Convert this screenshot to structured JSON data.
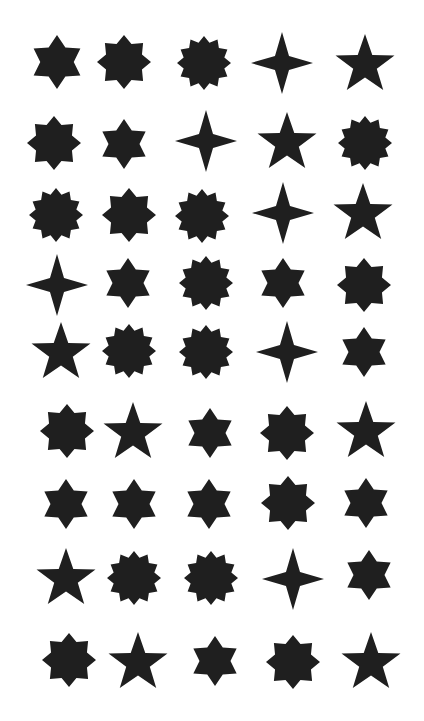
{
  "fill_color": "#1f1f1f",
  "background_color": "#ffffff",
  "grid": {
    "rows": 9,
    "columns": 5
  },
  "shapes": [
    {
      "row": 1,
      "col": 1,
      "points": 6,
      "cx": 57,
      "cy": 62,
      "r": 27,
      "inner": 0.62
    },
    {
      "row": 1,
      "col": 2,
      "points": 8,
      "cx": 124,
      "cy": 62,
      "r": 27,
      "inner": 0.72
    },
    {
      "row": 1,
      "col": 3,
      "points": 12,
      "cx": 204,
      "cy": 63,
      "r": 27,
      "inner": 0.78
    },
    {
      "row": 1,
      "col": 4,
      "points": 4,
      "cx": 282,
      "cy": 63,
      "r": 31,
      "inner": 0.32
    },
    {
      "row": 1,
      "col": 5,
      "points": 5,
      "cx": 365,
      "cy": 65,
      "r": 31,
      "inner": 0.4
    },
    {
      "row": 2,
      "col": 1,
      "points": 8,
      "cx": 54,
      "cy": 143,
      "r": 27,
      "inner": 0.72
    },
    {
      "row": 2,
      "col": 2,
      "points": 6,
      "cx": 124,
      "cy": 144,
      "r": 25,
      "inner": 0.62
    },
    {
      "row": 2,
      "col": 3,
      "points": 4,
      "cx": 206,
      "cy": 141,
      "r": 31,
      "inner": 0.32
    },
    {
      "row": 2,
      "col": 4,
      "points": 5,
      "cx": 287,
      "cy": 143,
      "r": 31,
      "inner": 0.4
    },
    {
      "row": 2,
      "col": 5,
      "points": 12,
      "cx": 365,
      "cy": 143,
      "r": 27,
      "inner": 0.78
    },
    {
      "row": 3,
      "col": 1,
      "points": 12,
      "cx": 56,
      "cy": 215,
      "r": 27,
      "inner": 0.78
    },
    {
      "row": 3,
      "col": 2,
      "points": 8,
      "cx": 129,
      "cy": 215,
      "r": 27,
      "inner": 0.72
    },
    {
      "row": 3,
      "col": 3,
      "points": 12,
      "cx": 202,
      "cy": 216,
      "r": 27,
      "inner": 0.78
    },
    {
      "row": 3,
      "col": 4,
      "points": 4,
      "cx": 283,
      "cy": 213,
      "r": 31,
      "inner": 0.32
    },
    {
      "row": 3,
      "col": 5,
      "points": 5,
      "cx": 363,
      "cy": 214,
      "r": 31,
      "inner": 0.4
    },
    {
      "row": 4,
      "col": 1,
      "points": 4,
      "cx": 57,
      "cy": 285,
      "r": 31,
      "inner": 0.32
    },
    {
      "row": 4,
      "col": 2,
      "points": 6,
      "cx": 128,
      "cy": 283,
      "r": 25,
      "inner": 0.62
    },
    {
      "row": 4,
      "col": 3,
      "points": 12,
      "cx": 206,
      "cy": 283,
      "r": 27,
      "inner": 0.78
    },
    {
      "row": 4,
      "col": 4,
      "points": 6,
      "cx": 283,
      "cy": 283,
      "r": 25,
      "inner": 0.62
    },
    {
      "row": 4,
      "col": 5,
      "points": 8,
      "cx": 364,
      "cy": 285,
      "r": 27,
      "inner": 0.72
    },
    {
      "row": 5,
      "col": 1,
      "points": 5,
      "cx": 61,
      "cy": 353,
      "r": 31,
      "inner": 0.4
    },
    {
      "row": 5,
      "col": 2,
      "points": 12,
      "cx": 129,
      "cy": 351,
      "r": 27,
      "inner": 0.78
    },
    {
      "row": 5,
      "col": 3,
      "points": 12,
      "cx": 206,
      "cy": 352,
      "r": 27,
      "inner": 0.78
    },
    {
      "row": 5,
      "col": 4,
      "points": 4,
      "cx": 287,
      "cy": 352,
      "r": 31,
      "inner": 0.32
    },
    {
      "row": 5,
      "col": 5,
      "points": 6,
      "cx": 364,
      "cy": 352,
      "r": 25,
      "inner": 0.62
    },
    {
      "row": 6,
      "col": 1,
      "points": 8,
      "cx": 67,
      "cy": 431,
      "r": 27,
      "inner": 0.72
    },
    {
      "row": 6,
      "col": 2,
      "points": 5,
      "cx": 133,
      "cy": 433,
      "r": 31,
      "inner": 0.4
    },
    {
      "row": 6,
      "col": 3,
      "points": 6,
      "cx": 210,
      "cy": 433,
      "r": 25,
      "inner": 0.62
    },
    {
      "row": 6,
      "col": 4,
      "points": 8,
      "cx": 287,
      "cy": 433,
      "r": 27,
      "inner": 0.72
    },
    {
      "row": 6,
      "col": 5,
      "points": 5,
      "cx": 366,
      "cy": 432,
      "r": 31,
      "inner": 0.4
    },
    {
      "row": 7,
      "col": 1,
      "points": 6,
      "cx": 66,
      "cy": 504,
      "r": 25,
      "inner": 0.62
    },
    {
      "row": 7,
      "col": 2,
      "points": 6,
      "cx": 134,
      "cy": 504,
      "r": 25,
      "inner": 0.62
    },
    {
      "row": 7,
      "col": 3,
      "points": 6,
      "cx": 209,
      "cy": 504,
      "r": 25,
      "inner": 0.62
    },
    {
      "row": 7,
      "col": 4,
      "points": 8,
      "cx": 288,
      "cy": 503,
      "r": 27,
      "inner": 0.72
    },
    {
      "row": 7,
      "col": 5,
      "points": 6,
      "cx": 366,
      "cy": 503,
      "r": 25,
      "inner": 0.62
    },
    {
      "row": 8,
      "col": 1,
      "points": 5,
      "cx": 66,
      "cy": 579,
      "r": 31,
      "inner": 0.4
    },
    {
      "row": 8,
      "col": 2,
      "points": 12,
      "cx": 134,
      "cy": 578,
      "r": 27,
      "inner": 0.78
    },
    {
      "row": 8,
      "col": 3,
      "points": 12,
      "cx": 211,
      "cy": 578,
      "r": 27,
      "inner": 0.78
    },
    {
      "row": 8,
      "col": 4,
      "points": 4,
      "cx": 293,
      "cy": 579,
      "r": 31,
      "inner": 0.32
    },
    {
      "row": 8,
      "col": 5,
      "points": 6,
      "cx": 369,
      "cy": 575,
      "r": 25,
      "inner": 0.62
    },
    {
      "row": 9,
      "col": 1,
      "points": 8,
      "cx": 69,
      "cy": 660,
      "r": 27,
      "inner": 0.72
    },
    {
      "row": 9,
      "col": 2,
      "points": 5,
      "cx": 138,
      "cy": 663,
      "r": 31,
      "inner": 0.4
    },
    {
      "row": 9,
      "col": 3,
      "points": 6,
      "cx": 215,
      "cy": 661,
      "r": 25,
      "inner": 0.62
    },
    {
      "row": 9,
      "col": 4,
      "points": 8,
      "cx": 293,
      "cy": 662,
      "r": 27,
      "inner": 0.72
    },
    {
      "row": 9,
      "col": 5,
      "points": 5,
      "cx": 371,
      "cy": 663,
      "r": 31,
      "inner": 0.4
    }
  ]
}
